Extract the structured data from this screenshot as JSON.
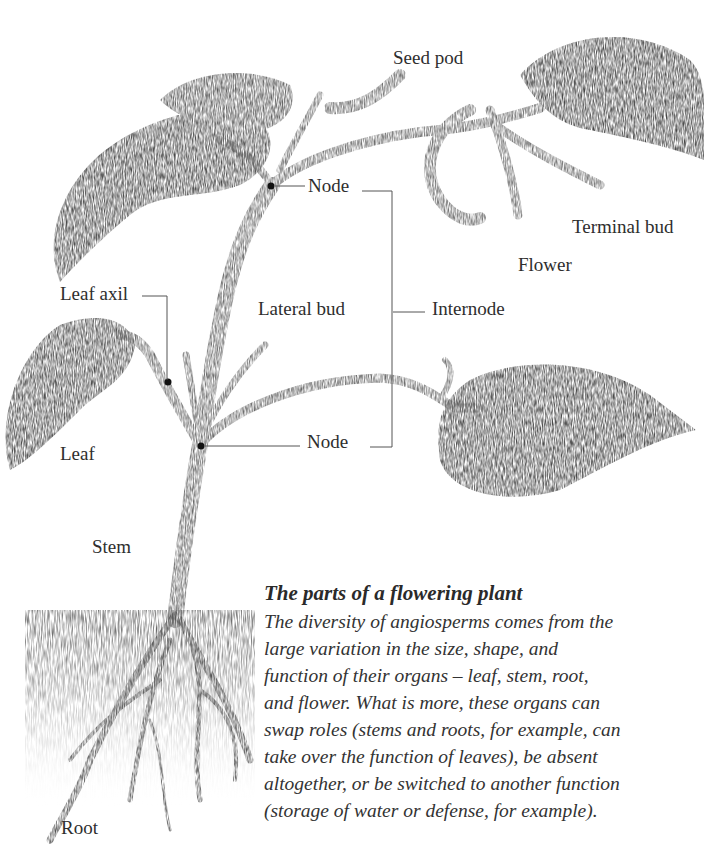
{
  "figure": {
    "title": "The parts of a flowering plant",
    "caption_lines": [
      "The diversity of angiosperms comes from the",
      "large variation in the size, shape, and",
      "function of their organs – leaf, stem, root,",
      "and flower. What is more, these organs can",
      "swap roles (stems and roots, for example, can",
      "take over the function of leaves), be absent",
      "altogether, or be switched to another function",
      "(storage of water or defense, for example)."
    ]
  },
  "labels": {
    "seed_pod": "Seed pod",
    "node_upper": "Node",
    "terminal_bud": "Terminal bud",
    "flower": "Flower",
    "leaf_axil": "Leaf axil",
    "lateral_bud": "Lateral bud",
    "internode": "Internode",
    "node_lower": "Node",
    "leaf": "Leaf",
    "stem": "Stem",
    "root": "Root"
  },
  "colors": {
    "ink": "#2e2e2e",
    "leader_line": "#555555",
    "background": "#ffffff"
  }
}
